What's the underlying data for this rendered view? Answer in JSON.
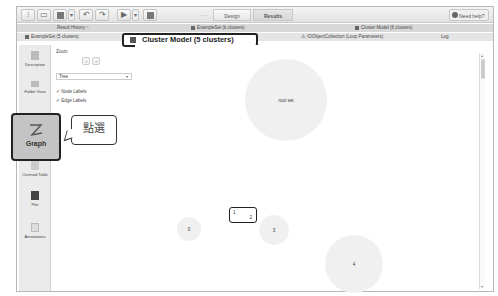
{
  "toolbar": {
    "buttons": [
      "new-process",
      "open",
      "save",
      "save-dropdown",
      "undo",
      "redo",
      "run",
      "run-dropdown",
      "stop"
    ],
    "views": [
      "Design",
      "Results"
    ],
    "active_view": "Results",
    "help_label": "Need help?"
  },
  "tabs": {
    "row1": [
      {
        "label": "Result History",
        "icon": "history-icon"
      },
      {
        "label": "ExampleSet (k clusters)",
        "icon": "table-icon"
      },
      {
        "label": "Cluster Model (6 clusters)",
        "icon": "model-icon"
      }
    ],
    "row2": [
      {
        "label": "ExampleSet (5 clusters)",
        "icon": "table-icon"
      },
      {
        "label": "Cluster Model (5 clusters)",
        "icon": "model-icon",
        "active": true
      },
      {
        "label": "IOObjectCollection (Loop Parameters)",
        "icon": "warning-icon"
      },
      {
        "label": "Log",
        "icon": ""
      }
    ]
  },
  "sidebar": {
    "items": [
      {
        "label": "Description",
        "icon": "description-icon"
      },
      {
        "label": "Folder View",
        "icon": "folder-icon"
      },
      {
        "label": "Graph",
        "icon": "graph-icon",
        "active": true
      },
      {
        "label": "Centroid Table",
        "icon": "table-icon"
      },
      {
        "label": "Plot",
        "icon": "plot-icon"
      },
      {
        "label": "Annotations",
        "icon": "annotations-icon"
      }
    ]
  },
  "panel": {
    "zoom_label": "Zoom",
    "zoom_in": "+",
    "zoom_out": "−",
    "layout_value": "Tree",
    "node_labels": "✓ Node Labels",
    "edge_labels": "✓ Edge Labels"
  },
  "callout": {
    "text": "點選"
  },
  "graph": {
    "nodes": [
      {
        "id": "root",
        "label": "root set"
      },
      {
        "id": "0",
        "label": "0"
      },
      {
        "id": "1",
        "label": "1"
      },
      {
        "id": "2",
        "label": "2"
      },
      {
        "id": "3",
        "label": "3"
      },
      {
        "id": "4",
        "label": "4"
      }
    ]
  }
}
